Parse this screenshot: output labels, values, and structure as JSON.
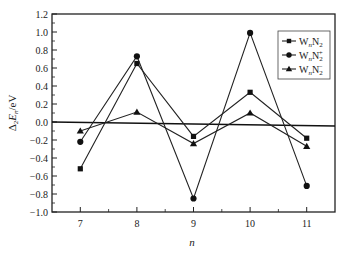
{
  "chart_data": {
    "type": "line",
    "title": "",
    "xlabel": "n",
    "ylabel": "Δ2En/eV",
    "x": [
      7,
      8,
      9,
      10,
      11
    ],
    "xlim": [
      6.5,
      11.5
    ],
    "ylim": [
      -1.0,
      1.2
    ],
    "yticks": [
      -1.0,
      -0.8,
      -0.6,
      -0.4,
      -0.2,
      0.0,
      0.2,
      0.4,
      0.6,
      0.8,
      1.0,
      1.2
    ],
    "xticks": [
      7,
      8,
      9,
      10,
      11
    ],
    "grid": false,
    "zero_line": true,
    "legend_position": "upper right",
    "series": [
      {
        "name": "WnN2",
        "label_base": "W",
        "label_sub1": "n",
        "label_mid": "N",
        "label_sub2": "2",
        "label_sup": "",
        "marker": "square",
        "values": [
          -0.52,
          0.65,
          -0.16,
          0.33,
          -0.18
        ]
      },
      {
        "name": "WnN2+",
        "label_base": "W",
        "label_sub1": "n",
        "label_mid": "N",
        "label_sub2": "2",
        "label_sup": "+",
        "marker": "circle",
        "values": [
          -0.22,
          0.73,
          -0.85,
          0.99,
          -0.71
        ]
      },
      {
        "name": "WnN2-",
        "label_base": "W",
        "label_sub1": "n",
        "label_mid": "N",
        "label_sub2": "2",
        "label_sup": "−",
        "marker": "triangle",
        "values": [
          -0.1,
          0.11,
          -0.24,
          0.1,
          -0.27
        ]
      }
    ]
  }
}
